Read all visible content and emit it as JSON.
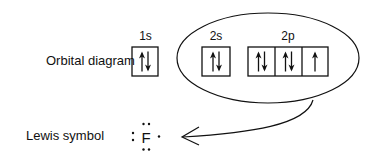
{
  "diagram": {
    "row_labels": {
      "orbital_diagram": "Orbital diagram",
      "lewis_symbol": "Lewis symbol"
    },
    "orbitals": [
      {
        "name": "1s",
        "boxes": [
          "up-down"
        ]
      },
      {
        "name": "2s",
        "boxes": [
          "up-down"
        ]
      },
      {
        "name": "2p",
        "boxes": [
          "up-down",
          "up-down",
          "up"
        ]
      }
    ],
    "valence_group": "ellipse around 2s and 2p",
    "lewis": {
      "element": "F",
      "dots": {
        "top": 2,
        "left": 2,
        "bottom": 2,
        "right": 1
      }
    },
    "arrow": "from valence ellipse to Lewis symbol"
  }
}
